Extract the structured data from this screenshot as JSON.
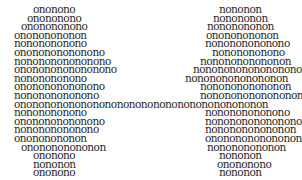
{
  "left": {
    "lines": [
      {
        "text": "ononono",
        "x": 33
      },
      {
        "text": "onononono",
        "x": 27
      },
      {
        "text": "ononononono",
        "x": 21
      },
      {
        "text": "onononononon",
        "x": 14
      },
      {
        "text": "nononononono",
        "x": 14
      },
      {
        "text": "ononononononono",
        "x": 14
      },
      {
        "text": "nononononononono",
        "x": 14
      },
      {
        "text": "onononononononono",
        "x": 14
      },
      {
        "text": "nononononono",
        "x": 14
      },
      {
        "text": "ononononononono",
        "x": 14
      },
      {
        "text": "nonononononono",
        "x": 14
      },
      {
        "text": "ononononononononononononononononononononon",
        "x": 14
      },
      {
        "text": "nononononono",
        "x": 14
      },
      {
        "text": "ononononononono",
        "x": 14
      },
      {
        "text": "nonononononono",
        "x": 14
      },
      {
        "text": "onononononon",
        "x": 14
      },
      {
        "text": "ononononononon",
        "x": 21
      },
      {
        "text": "ononono",
        "x": 33
      },
      {
        "text": "nononon",
        "x": 33
      },
      {
        "text": "ononono",
        "x": 33
      }
    ]
  },
  "right": {
    "lines": [
      {
        "text": "nononon",
        "x": 219
      },
      {
        "text": "nonononon",
        "x": 213
      },
      {
        "text": "nononononon",
        "x": 207
      },
      {
        "text": "onononononon",
        "x": 206
      },
      {
        "text": "nonononononono",
        "x": 205
      },
      {
        "text": "nononononono",
        "x": 212
      },
      {
        "text": "nononononononon",
        "x": 200
      },
      {
        "text": "nonononononononono",
        "x": 193
      },
      {
        "text": "nonononononononon",
        "x": 185
      },
      {
        "text": "nononononononon",
        "x": 200
      },
      {
        "text": "nonononononononon",
        "x": 200
      },
      {
        "text": "",
        "x": 0
      },
      {
        "text": "nonononononono",
        "x": 205
      },
      {
        "text": "nononononononono",
        "x": 205
      },
      {
        "text": "nononononononon",
        "x": 205
      },
      {
        "text": "onononononononon",
        "x": 205
      },
      {
        "text": "nonononononon",
        "x": 207
      },
      {
        "text": "nononon",
        "x": 219
      },
      {
        "text": "onononono",
        "x": 217
      },
      {
        "text": "nononon",
        "x": 219
      }
    ]
  }
}
